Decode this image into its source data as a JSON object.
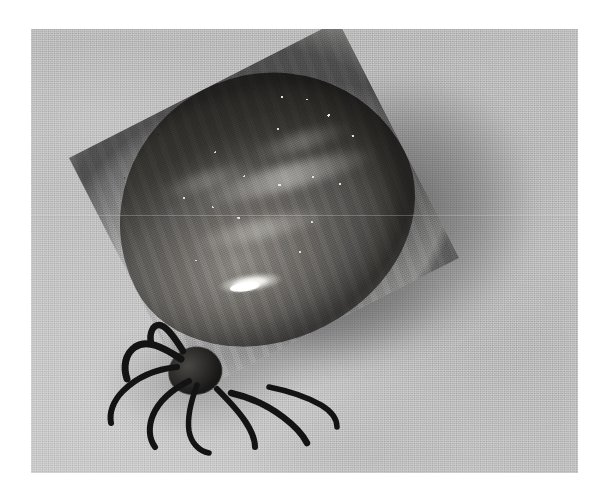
{
  "image": {
    "subject": "engorged-tick",
    "description": "Close-up black-and-white photograph of a fully engorged tick resting on a light gray textured surface, with its legs and mouthparts at the lower left and a soft cast shadow at the upper right.",
    "medium": "grayscale-photograph",
    "canvas": {
      "width": 604,
      "height": 501,
      "background": "#ffffff"
    },
    "photo_frame": {
      "left": 31,
      "top": 29,
      "width": 547,
      "height": 444
    },
    "colors": {
      "page_background": "#ffffff",
      "surface_light": "#c9c9c9",
      "surface_mid": "#bcbcbc",
      "surface_dark": "#b4b4b4",
      "body_highlight": "#8d8a85",
      "body_mid": "#6e6b67",
      "body_shadow": "#46443f",
      "body_rim_dark": "#1d1d1d",
      "specular_white": "#ffffff",
      "leg_dark": "#131313",
      "cast_shadow": "#2a2a2a"
    },
    "elements": {
      "body_label": "engorged idiosoma",
      "capitulum_label": "capitulum",
      "legs_label": "legs",
      "shadow_label": "cast shadow",
      "surface_label": "textured background surface",
      "highlight_label": "specular highlight"
    },
    "body_geometry": {
      "left": 113,
      "top": 75,
      "width": 302,
      "height": 266,
      "rotation_deg": -27
    },
    "leg_paths": [
      "M150,330 C132,318 116,310 104,318 C94,325 92,338 96,350",
      "M146,338 C126,340 106,348 92,362 C82,372 78,384 80,394",
      "M158,352 C142,360 128,372 122,386 C117,398 118,410 124,418",
      "M166,356 C160,372 156,388 158,402 C160,414 168,422 178,424",
      "M152,322 C142,306 134,296 128,296 C122,296 118,304 120,314",
      "M186,360 C196,370 206,380 214,392 C220,401 224,410 224,418",
      "M200,364 C218,368 236,376 252,388 C264,397 272,406 276,414",
      "M238,358 C258,362 276,368 290,376 C300,382 306,390 306,398"
    ]
  }
}
